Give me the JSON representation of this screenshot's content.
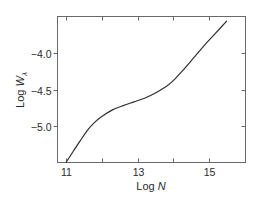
{
  "chart_data": {
    "type": "line",
    "title": "",
    "xlabel": "Log N",
    "xlabel_parts": {
      "prefix": "Log ",
      "var": "N"
    },
    "ylabel": "Log W_λ",
    "ylabel_parts": {
      "prefix": "Log ",
      "var": "W",
      "sub": "λ"
    },
    "xlim": [
      10.75,
      15.95
    ],
    "ylim": [
      -5.5,
      -3.5
    ],
    "grid": false,
    "legend": null,
    "x_ticks": [
      11,
      12,
      13,
      14,
      15
    ],
    "x_tick_labels": [
      "11",
      "",
      "13",
      "",
      "15"
    ],
    "y_ticks": [
      -4.0,
      -4.5,
      -5.0
    ],
    "y_tick_labels": [
      "-4.0",
      "-4.5",
      "-5.0"
    ],
    "series": [
      {
        "name": "curve of growth",
        "x": [
          11.0,
          11.2,
          11.4,
          11.6,
          11.8,
          12.0,
          12.3,
          12.6,
          12.9,
          13.2,
          13.5,
          13.8,
          14.0,
          14.3,
          14.6,
          14.9,
          15.2,
          15.5
        ],
        "y": [
          -5.5,
          -5.35,
          -5.2,
          -5.06,
          -4.95,
          -4.87,
          -4.78,
          -4.72,
          -4.67,
          -4.62,
          -4.55,
          -4.46,
          -4.38,
          -4.22,
          -4.05,
          -3.88,
          -3.72,
          -3.56
        ]
      }
    ]
  }
}
